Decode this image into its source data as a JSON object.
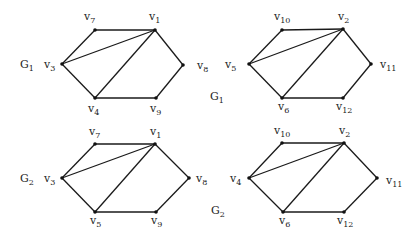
{
  "graphs": [
    {
      "id": "G1-left",
      "name": "G",
      "name_sub": "1",
      "name_pos": [
        20,
        68
      ],
      "vertices": [
        {
          "id": "v7",
          "base": "v",
          "sub": "7",
          "x": 95,
          "y": 30,
          "lx": 84,
          "ly": 20
        },
        {
          "id": "v1",
          "base": "v",
          "sub": "1",
          "x": 155,
          "y": 30,
          "lx": 149,
          "ly": 20
        },
        {
          "id": "v3",
          "base": "v",
          "sub": "3",
          "x": 62,
          "y": 64,
          "lx": 44,
          "ly": 68
        },
        {
          "id": "v8",
          "base": "v",
          "sub": "8",
          "x": 183,
          "y": 65,
          "lx": 197,
          "ly": 69
        },
        {
          "id": "v4",
          "base": "v",
          "sub": "4",
          "x": 95,
          "y": 98,
          "lx": 88,
          "ly": 112
        },
        {
          "id": "v9",
          "base": "v",
          "sub": "9",
          "x": 156,
          "y": 98,
          "lx": 150,
          "ly": 112
        }
      ],
      "edges": [
        [
          "v7",
          "v1"
        ],
        [
          "v3",
          "v7"
        ],
        [
          "v3",
          "v1"
        ],
        [
          "v3",
          "v4"
        ],
        [
          "v4",
          "v1"
        ],
        [
          "v1",
          "v8"
        ],
        [
          "v8",
          "v9"
        ],
        [
          "v4",
          "v9"
        ]
      ]
    },
    {
      "id": "G1-right",
      "name": "G",
      "name_sub": "1",
      "name_pos": [
        210,
        100
      ],
      "vertices": [
        {
          "id": "v10",
          "base": "v",
          "sub": "10",
          "x": 282,
          "y": 30,
          "lx": 274,
          "ly": 20
        },
        {
          "id": "v2",
          "base": "v",
          "sub": "2",
          "x": 343,
          "y": 29,
          "lx": 338,
          "ly": 20
        },
        {
          "id": "v5",
          "base": "v",
          "sub": "5",
          "x": 249,
          "y": 64,
          "lx": 225,
          "ly": 68
        },
        {
          "id": "v11",
          "base": "v",
          "sub": "11",
          "x": 371,
          "y": 64,
          "lx": 380,
          "ly": 68
        },
        {
          "id": "v6",
          "base": "v",
          "sub": "6",
          "x": 282,
          "y": 98,
          "lx": 278,
          "ly": 110
        },
        {
          "id": "v12",
          "base": "v",
          "sub": "12",
          "x": 343,
          "y": 98,
          "lx": 336,
          "ly": 110
        }
      ],
      "edges": [
        [
          "v10",
          "v2"
        ],
        [
          "v5",
          "v10"
        ],
        [
          "v5",
          "v2"
        ],
        [
          "v5",
          "v6"
        ],
        [
          "v6",
          "v2"
        ],
        [
          "v2",
          "v11"
        ],
        [
          "v11",
          "v12"
        ],
        [
          "v6",
          "v12"
        ]
      ]
    },
    {
      "id": "G2-left",
      "name": "G",
      "name_sub": "2",
      "name_pos": [
        20,
        182
      ],
      "vertices": [
        {
          "id": "v7",
          "base": "v",
          "sub": "7",
          "x": 95,
          "y": 144,
          "lx": 89,
          "ly": 135
        },
        {
          "id": "v1",
          "base": "v",
          "sub": "1",
          "x": 155,
          "y": 144,
          "lx": 150,
          "ly": 135
        },
        {
          "id": "v3",
          "base": "v",
          "sub": "3",
          "x": 62,
          "y": 178,
          "lx": 44,
          "ly": 182
        },
        {
          "id": "v8",
          "base": "v",
          "sub": "8",
          "x": 189,
          "y": 178,
          "lx": 196,
          "ly": 182
        },
        {
          "id": "v5",
          "base": "v",
          "sub": "5",
          "x": 95,
          "y": 212,
          "lx": 90,
          "ly": 224
        },
        {
          "id": "v9",
          "base": "v",
          "sub": "9",
          "x": 156,
          "y": 212,
          "lx": 151,
          "ly": 224
        }
      ],
      "edges": [
        [
          "v7",
          "v1"
        ],
        [
          "v3",
          "v7"
        ],
        [
          "v3",
          "v1"
        ],
        [
          "v3",
          "v5"
        ],
        [
          "v5",
          "v1"
        ],
        [
          "v1",
          "v8"
        ],
        [
          "v8",
          "v9"
        ],
        [
          "v5",
          "v9"
        ]
      ]
    },
    {
      "id": "G2-right",
      "name": "G",
      "name_sub": "2",
      "name_pos": [
        211,
        214
      ],
      "vertices": [
        {
          "id": "v10",
          "base": "v",
          "sub": "10",
          "x": 282,
          "y": 143,
          "lx": 274,
          "ly": 134
        },
        {
          "id": "v2",
          "base": "v",
          "sub": "2",
          "x": 344,
          "y": 143,
          "lx": 339,
          "ly": 134
        },
        {
          "id": "v4",
          "base": "v",
          "sub": "4",
          "x": 249,
          "y": 178,
          "lx": 230,
          "ly": 182
        },
        {
          "id": "v11",
          "base": "v",
          "sub": "11",
          "x": 377,
          "y": 178,
          "lx": 386,
          "ly": 184
        },
        {
          "id": "v6",
          "base": "v",
          "sub": "6",
          "x": 283,
          "y": 212,
          "lx": 279,
          "ly": 224
        },
        {
          "id": "v12",
          "base": "v",
          "sub": "12",
          "x": 344,
          "y": 212,
          "lx": 337,
          "ly": 224
        }
      ],
      "edges": [
        [
          "v10",
          "v2"
        ],
        [
          "v4",
          "v10"
        ],
        [
          "v4",
          "v2"
        ],
        [
          "v4",
          "v6"
        ],
        [
          "v6",
          "v2"
        ],
        [
          "v2",
          "v11"
        ],
        [
          "v11",
          "v12"
        ],
        [
          "v6",
          "v12"
        ]
      ]
    }
  ]
}
